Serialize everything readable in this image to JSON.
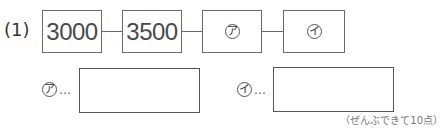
{
  "problem": {
    "number_label": "(1)",
    "chain": [
      {
        "type": "number",
        "value": "3000"
      },
      {
        "type": "number",
        "value": "3500"
      },
      {
        "type": "blank",
        "marker": "ア"
      },
      {
        "type": "blank",
        "marker": "イ"
      }
    ],
    "answers": [
      {
        "marker": "ア",
        "leader": "…",
        "value": ""
      },
      {
        "marker": "イ",
        "leader": "…",
        "value": ""
      }
    ],
    "score_note": "（ぜんぶできて10点）"
  }
}
